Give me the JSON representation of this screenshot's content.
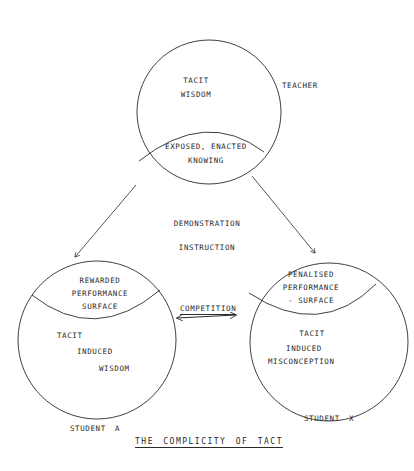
{
  "diagram": {
    "title": "THE COMPLICITY OF TACT",
    "nodes": {
      "teacher": {
        "role_label": "TEACHER",
        "upper_text": [
          "TACIT",
          "WISDOM"
        ],
        "lower_text": [
          "EXPOSED, ENACTED",
          "KNOWING"
        ]
      },
      "student_a": {
        "role_label": "STUDENT A",
        "upper_text": [
          "REWARDED",
          "PERFORMANCE",
          "SURFACE"
        ],
        "lower_text": [
          "TACIT",
          "INDUCED",
          "WISDOM"
        ]
      },
      "student_x": {
        "role_label": "STUDENT X",
        "upper_text": [
          "PENALISED",
          "PERFORMANCE",
          "- SURFACE"
        ],
        "lower_text": [
          "TACIT",
          "INDUCED",
          "MISCONCEPTION"
        ]
      }
    },
    "edges": {
      "teacher_to_students_label": [
        "DEMONSTRATION",
        "INSTRUCTION"
      ],
      "between_students_label": "COMPETITION"
    },
    "colors": {
      "ink": "#2a2a2a",
      "background": "#ffffff"
    }
  }
}
